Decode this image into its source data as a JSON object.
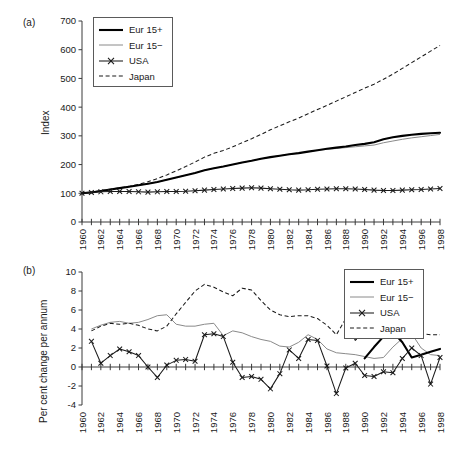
{
  "figure": {
    "panels": [
      {
        "id": "a",
        "label": "(a)",
        "ylabel": "Index",
        "xlabel": ""
      },
      {
        "id": "b",
        "label": "(b)",
        "ylabel": "Per cent change per annum",
        "xlabel": ""
      }
    ],
    "legend_labels": [
      "Eur 15+",
      "Eur 15−",
      "USA",
      "Japan"
    ],
    "colors": {
      "eur15plus": "#000000",
      "eur15minus": "#8a8a8a",
      "usa": "#1a1a1a",
      "japan": "#1a1a1a",
      "axis": "#3a3a3a",
      "background": "#ffffff"
    }
  },
  "chart_data": [
    {
      "type": "line",
      "panel": "a",
      "title": "",
      "xlabel": "",
      "ylabel": "Index",
      "xlim": [
        1960,
        1998
      ],
      "ylim": [
        0,
        700
      ],
      "yticks": [
        0,
        100,
        200,
        300,
        400,
        500,
        600,
        700
      ],
      "xticks": [
        1960,
        1962,
        1964,
        1966,
        1968,
        1970,
        1972,
        1974,
        1976,
        1978,
        1980,
        1982,
        1984,
        1986,
        1988,
        1990,
        1992,
        1994,
        1996,
        1998
      ],
      "xtick_minor_every": 1,
      "grid": false,
      "legend_position": "upper-left-inside",
      "x": [
        1960,
        1961,
        1962,
        1963,
        1964,
        1965,
        1966,
        1967,
        1968,
        1969,
        1970,
        1971,
        1972,
        1973,
        1974,
        1975,
        1976,
        1977,
        1978,
        1979,
        1980,
        1981,
        1982,
        1983,
        1984,
        1985,
        1986,
        1987,
        1988,
        1989,
        1990,
        1991,
        1992,
        1993,
        1994,
        1995,
        1996,
        1997,
        1998
      ],
      "series": [
        {
          "name": "Eur 15+",
          "style": "thick-solid",
          "values": [
            100,
            103,
            108,
            113,
            118,
            123,
            128,
            133,
            139,
            147,
            155,
            163,
            171,
            180,
            187,
            193,
            200,
            207,
            213,
            220,
            226,
            231,
            236,
            240,
            245,
            250,
            255,
            259,
            263,
            268,
            272,
            278,
            288,
            295,
            300,
            304,
            307,
            309,
            311
          ]
        },
        {
          "name": "Eur 15−",
          "style": "thin-solid",
          "values": [
            100,
            103,
            108,
            113,
            118,
            123,
            128,
            133,
            139,
            147,
            155,
            163,
            171,
            180,
            187,
            193,
            200,
            207,
            213,
            220,
            226,
            231,
            236,
            240,
            245,
            250,
            253,
            256,
            259,
            262,
            265,
            268,
            276,
            282,
            288,
            293,
            297,
            301,
            305
          ]
        },
        {
          "name": "USA",
          "style": "solid-markers",
          "values": [
            100,
            103,
            105,
            106,
            106,
            106,
            105,
            104,
            105,
            106,
            106,
            107,
            109,
            111,
            113,
            115,
            117,
            118,
            119,
            118,
            116,
            114,
            112,
            111,
            112,
            114,
            115,
            116,
            116,
            115,
            113,
            111,
            110,
            110,
            111,
            112,
            113,
            115,
            117
          ]
        },
        {
          "name": "Japan",
          "style": "dashed",
          "values": [
            100,
            104,
            109,
            114,
            119,
            124,
            131,
            140,
            151,
            164,
            178,
            193,
            209,
            226,
            239,
            249,
            262,
            276,
            290,
            305,
            321,
            335,
            349,
            362,
            377,
            392,
            406,
            421,
            436,
            451,
            466,
            480,
            497,
            515,
            535,
            555,
            575,
            595,
            615
          ]
        }
      ]
    },
    {
      "type": "line",
      "panel": "b",
      "title": "",
      "xlabel": "",
      "ylabel": "Per cent change per annum",
      "xlim": [
        1960,
        1998
      ],
      "ylim": [
        -4,
        10
      ],
      "yticks": [
        -4,
        -2,
        0,
        2,
        4,
        6,
        8,
        10
      ],
      "xticks": [
        1960,
        1962,
        1964,
        1966,
        1968,
        1970,
        1972,
        1974,
        1976,
        1978,
        1980,
        1982,
        1984,
        1986,
        1988,
        1990,
        1992,
        1994,
        1996,
        1998
      ],
      "xtick_minor_every": 1,
      "grid": false,
      "legend_position": "upper-right-inside",
      "x": [
        1961,
        1962,
        1963,
        1964,
        1965,
        1966,
        1967,
        1968,
        1969,
        1970,
        1971,
        1972,
        1973,
        1974,
        1975,
        1976,
        1977,
        1978,
        1979,
        1980,
        1981,
        1982,
        1983,
        1984,
        1985,
        1986,
        1987,
        1988,
        1989,
        1990,
        1991,
        1992,
        1993,
        1994,
        1995,
        1996,
        1997,
        1998
      ],
      "series": [
        {
          "name": "Eur 15+",
          "style": "thick-solid",
          "start_year": 1990,
          "values": [
            null,
            null,
            null,
            null,
            null,
            null,
            null,
            null,
            null,
            null,
            null,
            null,
            null,
            null,
            null,
            null,
            null,
            null,
            null,
            null,
            null,
            null,
            null,
            null,
            null,
            null,
            null,
            null,
            null,
            0.9,
            2.1,
            3.2,
            3.7,
            2.6,
            1.0,
            1.3,
            1.6,
            1.9
          ]
        },
        {
          "name": "Eur 15−",
          "style": "thin-solid",
          "values": [
            4.0,
            4.4,
            4.7,
            4.8,
            4.6,
            4.7,
            5.0,
            5.4,
            5.5,
            4.5,
            4.3,
            4.3,
            4.5,
            4.6,
            3.3,
            3.8,
            3.6,
            3.2,
            2.9,
            2.7,
            2.2,
            2.1,
            2.6,
            3.4,
            2.9,
            1.9,
            1.5,
            1.4,
            1.3,
            1.1,
            0.9,
            1.0,
            2.1,
            3.0,
            3.5,
            2.0,
            1.3,
            1.2,
            1.0
          ]
        },
        {
          "name": "USA",
          "style": "solid-markers",
          "values": [
            2.7,
            0.4,
            1.2,
            1.9,
            1.6,
            1.2,
            0.0,
            -1.1,
            0.2,
            0.7,
            0.8,
            0.6,
            3.4,
            3.5,
            3.2,
            0.5,
            -1.1,
            -1.0,
            -1.3,
            -2.3,
            -0.7,
            1.8,
            0.9,
            2.9,
            2.8,
            0.1,
            -2.8,
            -0.1,
            0.4,
            -0.9,
            -1.0,
            -0.5,
            -0.6,
            0.9,
            2.0,
            1.2,
            -1.8,
            1.0,
            1.4,
            1.9
          ]
        },
        {
          "name": "Japan",
          "style": "dashed",
          "values": [
            3.8,
            4.3,
            4.6,
            4.5,
            4.6,
            4.4,
            4.0,
            3.8,
            4.3,
            5.6,
            6.8,
            8.0,
            8.7,
            8.4,
            7.9,
            7.5,
            8.3,
            8.1,
            7.0,
            6.0,
            5.5,
            5.3,
            5.4,
            5.4,
            5.1,
            4.4,
            3.4,
            5.1,
            2.8,
            3.6,
            4.1,
            3.8,
            3.7,
            3.5,
            3.1,
            3.5,
            3.4,
            3.4,
            3.2,
            2.0
          ]
        }
      ]
    }
  ]
}
